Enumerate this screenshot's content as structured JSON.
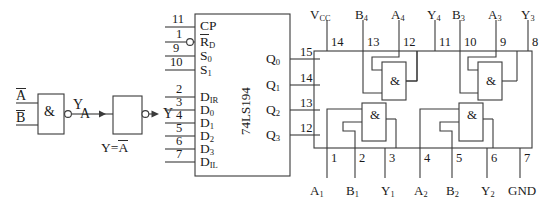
{
  "figure": {
    "background": "#ffffff",
    "line_color": "#3a3a3a",
    "text_color": "#1a1a1a"
  },
  "left_circuit": {
    "name": "nand-inverter-logic-circuit",
    "nand_gate": {
      "symbol": "&",
      "inputs": [
        {
          "label": "A",
          "overline": true
        },
        {
          "label": "B",
          "overline": true
        }
      ],
      "output_label": "Y",
      "has_output_bubble": true
    },
    "wire_label": "A",
    "inverter": {
      "symbol": "",
      "input_label": "A",
      "output_label": "Y",
      "has_output_bubble": true,
      "caption_prefix": "Y=",
      "caption_var": "A"
    }
  },
  "ic_194": {
    "name": "74LS194-shift-register",
    "part_number": "74LS194",
    "left_pins_top": [
      {
        "pin": "11",
        "label": "CP",
        "overline": false,
        "bubble": false
      },
      {
        "pin": "1",
        "label": "R",
        "sub": "D",
        "overline": true,
        "bubble": true
      },
      {
        "pin": "9",
        "label": "S",
        "sub": "0",
        "overline": false,
        "bubble": false
      },
      {
        "pin": "10",
        "label": "S",
        "sub": "1",
        "overline": false,
        "bubble": false
      }
    ],
    "left_pins_bottom": [
      {
        "pin": "2",
        "label": "D",
        "sub": "IR"
      },
      {
        "pin": "3",
        "label": "D",
        "sub": "0"
      },
      {
        "pin": "4",
        "label": "D",
        "sub": "1"
      },
      {
        "pin": "5",
        "label": "D",
        "sub": "2"
      },
      {
        "pin": "6",
        "label": "D",
        "sub": "3"
      },
      {
        "pin": "7",
        "label": "D",
        "sub": "IL"
      }
    ],
    "right_pins": [
      {
        "pin": "15",
        "label": "Q",
        "sub": "0"
      },
      {
        "pin": "14",
        "label": "Q",
        "sub": "1"
      },
      {
        "pin": "13",
        "label": "Q",
        "sub": "2"
      },
      {
        "pin": "12",
        "label": "Q",
        "sub": "3"
      }
    ]
  },
  "ic_7400": {
    "name": "quad-nand-package-pinout",
    "gate_symbol": "&",
    "top_labels": [
      {
        "label": "V",
        "sub": "CC"
      },
      {
        "label": "B",
        "sub": "4"
      },
      {
        "label": "A",
        "sub": "4"
      },
      {
        "label": "Y",
        "sub": "4"
      },
      {
        "label": "B",
        "sub": "3"
      },
      {
        "label": "A",
        "sub": "3"
      },
      {
        "label": "Y",
        "sub": "3"
      }
    ],
    "top_pins": [
      "14",
      "13",
      "12",
      "11",
      "10",
      "9",
      "8"
    ],
    "bottom_pins": [
      "1",
      "2",
      "3",
      "4",
      "5",
      "6",
      "7"
    ],
    "bottom_labels": [
      {
        "label": "A",
        "sub": "1"
      },
      {
        "label": "B",
        "sub": "1"
      },
      {
        "label": "Y",
        "sub": "1"
      },
      {
        "label": "A",
        "sub": "2"
      },
      {
        "label": "B",
        "sub": "2"
      },
      {
        "label": "Y",
        "sub": "2"
      },
      {
        "label": "GND",
        "sub": ""
      }
    ],
    "gates": [
      {
        "id": "gate-4",
        "symbol": "&"
      },
      {
        "id": "gate-3",
        "symbol": "&"
      },
      {
        "id": "gate-1",
        "symbol": "&"
      },
      {
        "id": "gate-2",
        "symbol": "&"
      }
    ]
  }
}
